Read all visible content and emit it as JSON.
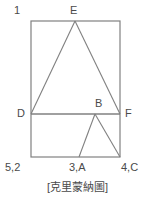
{
  "figure": {
    "caption": "[克里蒙納圖]",
    "stroke_color": "#808080",
    "text_color": "#4a4a4a",
    "background_color": "#ffffff",
    "labels": {
      "top_left": "1",
      "apex_top": "E",
      "left_mid": "D",
      "inner_apex": "B",
      "right_mid": "F",
      "bottom_left": "5,2",
      "bottom_center": "3,A",
      "bottom_right": "4,C"
    },
    "geometry": {
      "rect": {
        "x1": 31,
        "y1": 21,
        "x2": 120,
        "y2": 157
      },
      "mid_line": {
        "x1": 31,
        "y1": 114,
        "x2": 120,
        "y2": 114
      },
      "upper_triangle": [
        [
          75,
          21
        ],
        [
          31,
          114
        ],
        [
          120,
          114
        ]
      ],
      "lower_triangle": [
        [
          95,
          114
        ],
        [
          79,
          157
        ],
        [
          120,
          157
        ]
      ]
    }
  }
}
